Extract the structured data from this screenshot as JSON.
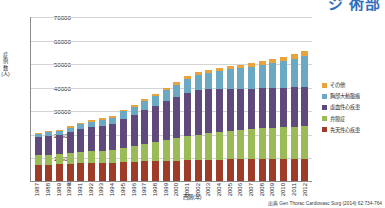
{
  "top_heading_partial": "ジ 術部",
  "axes": {
    "y_label": "症例数(人)",
    "x_label": "西暦(年)",
    "y_ticks": [
      "70000",
      "60000",
      "50000",
      "40000",
      "30000",
      "20000",
      "10000",
      "0"
    ]
  },
  "source_note": "出典  Gen Thorac Cardiovasc Surg (2014) 62:734-764",
  "legend": {
    "items": [
      {
        "label": "その他",
        "color": "#e8a33d"
      },
      {
        "label": "胸部大動脈瘤",
        "color": "#6aa8c4"
      },
      {
        "label": "虚血性心疾患",
        "color": "#604a7b"
      },
      {
        "label": "弁膜症",
        "color": "#9bbb59"
      },
      {
        "label": "先天性心疾患",
        "color": "#9e3b29"
      }
    ]
  },
  "chart_data": {
    "type": "bar",
    "stacked": true,
    "title": "",
    "xlabel": "西暦(年)",
    "ylabel": "症例数(人)",
    "ylim": [
      0,
      70000
    ],
    "ytick_step": 10000,
    "grid": true,
    "legend_position": "right",
    "categories": [
      "1987",
      "1988",
      "1989",
      "1990",
      "1991",
      "1992",
      "1993",
      "1994",
      "1995",
      "1996",
      "1997",
      "1998",
      "1999",
      "2000",
      "2001",
      "2002",
      "2003",
      "2004",
      "2005",
      "2006",
      "2007",
      "2008",
      "2009",
      "2010",
      "2011",
      "2012"
    ],
    "series": [
      {
        "name": "先天性心疾患",
        "color": "#9e3b29",
        "values": [
          6900,
          7000,
          7100,
          7300,
          7500,
          7600,
          7700,
          7800,
          8000,
          8200,
          8400,
          8500,
          8600,
          8700,
          8800,
          8900,
          9000,
          9100,
          9150,
          9200,
          9250,
          9300,
          9300,
          9350,
          9400,
          9400
        ]
      },
      {
        "name": "弁膜症",
        "color": "#9bbb59",
        "values": [
          4100,
          4200,
          4300,
          4500,
          4800,
          5000,
          5200,
          5400,
          6000,
          6500,
          7200,
          7900,
          8800,
          9500,
          10200,
          10800,
          11300,
          11700,
          12100,
          12400,
          12700,
          13000,
          13200,
          13400,
          13600,
          13900
        ]
      },
      {
        "name": "虚血性心疾患",
        "color": "#604a7b",
        "values": [
          7600,
          7800,
          8000,
          9000,
          9600,
          10200,
          10600,
          11000,
          12500,
          13500,
          14500,
          15500,
          16500,
          17500,
          18500,
          19000,
          18800,
          18400,
          18000,
          17600,
          17300,
          17100,
          17000,
          16900,
          16800,
          16700
        ]
      },
      {
        "name": "胸部大動脈瘤",
        "color": "#6aa8c4",
        "values": [
          1500,
          1600,
          1700,
          1900,
          2100,
          2400,
          2500,
          2700,
          3100,
          3400,
          3800,
          4200,
          4700,
          5200,
          5800,
          6300,
          6900,
          7500,
          8100,
          8700,
          9300,
          9900,
          10500,
          11200,
          12000,
          13000
        ]
      },
      {
        "name": "その他",
        "color": "#e8a33d",
        "values": [
          400,
          420,
          450,
          480,
          520,
          560,
          600,
          640,
          700,
          760,
          820,
          880,
          950,
          1020,
          1100,
          1180,
          1250,
          1320,
          1400,
          1480,
          1560,
          1640,
          1720,
          1800,
          1900,
          2000
        ]
      }
    ],
    "totals": [
      20500,
      21020,
      21550,
      23180,
      24520,
      25760,
      26600,
      27540,
      30300,
      32360,
      34720,
      36980,
      39550,
      41920,
      44400,
      46180,
      47250,
      48020,
      48750,
      49380,
      50110,
      50940,
      51720,
      52650,
      53700,
      55000
    ]
  }
}
